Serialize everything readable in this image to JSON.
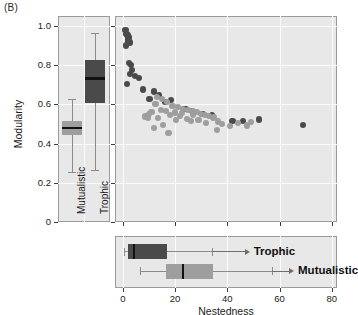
{
  "panel_label": "(B)",
  "colors": {
    "trophic": "#4a4a4a",
    "mutualistic": "#9e9e9e",
    "plot_bg": "#e8e8e8",
    "grid": "#fbfbfb",
    "frame": "#9b9b9b",
    "median": "#111111",
    "whisker": "#8b8b8b"
  },
  "modularity_axis": {
    "label": "Modularity",
    "ticks": [
      "0",
      "0.2",
      "0.4",
      "0.6",
      "0.8",
      "1.0"
    ],
    "values": [
      0,
      0.2,
      0.4,
      0.6,
      0.8,
      1.0
    ],
    "min": 0,
    "max": 1.05
  },
  "nestedness_axis": {
    "label": "Nestedness",
    "ticks": [
      "0",
      "20",
      "40",
      "60",
      "80"
    ],
    "values": [
      0,
      20,
      40,
      60,
      80
    ],
    "min": -3,
    "max": 82
  },
  "group_names": {
    "mutualistic": "Mutualistic",
    "trophic": "Trophic"
  },
  "chart_data": {
    "type": "scatter",
    "title": "(B)",
    "xlabel": "Nestedness",
    "ylabel": "Modularity",
    "xlim": [
      -3,
      82
    ],
    "ylim": [
      0,
      1.05
    ],
    "grid": true,
    "legend": "none",
    "series": [
      {
        "name": "Trophic",
        "color": "#4a4a4a",
        "points": [
          [
            1.0,
            0.98
          ],
          [
            1.4,
            0.96
          ],
          [
            1.8,
            0.955
          ],
          [
            2.2,
            0.94
          ],
          [
            2.0,
            0.925
          ],
          [
            2.6,
            0.915
          ],
          [
            1.2,
            0.9
          ],
          [
            2.4,
            0.81
          ],
          [
            3.0,
            0.8
          ],
          [
            3.6,
            0.775
          ],
          [
            2.8,
            0.755
          ],
          [
            4.6,
            0.745
          ],
          [
            6.2,
            0.735
          ],
          [
            1.6,
            0.705
          ],
          [
            7.8,
            0.675
          ],
          [
            12.0,
            0.665
          ],
          [
            14.0,
            0.645
          ],
          [
            10.2,
            0.628
          ],
          [
            18.5,
            0.622
          ],
          [
            16.0,
            0.612
          ],
          [
            24.0,
            0.575
          ],
          [
            26.5,
            0.565
          ],
          [
            30.5,
            0.552
          ],
          [
            34.0,
            0.545
          ],
          [
            42.0,
            0.515
          ],
          [
            46.0,
            0.515
          ],
          [
            52.0,
            0.522
          ],
          [
            69.0,
            0.495
          ]
        ]
      },
      {
        "name": "Mutualistic",
        "color": "#9e9e9e",
        "points": [
          [
            13.0,
            0.638
          ],
          [
            15.0,
            0.625
          ],
          [
            17.0,
            0.612
          ],
          [
            12.5,
            0.6
          ],
          [
            19.0,
            0.592
          ],
          [
            21.0,
            0.585
          ],
          [
            23.0,
            0.578
          ],
          [
            14.5,
            0.572
          ],
          [
            16.5,
            0.566
          ],
          [
            11.0,
            0.56
          ],
          [
            20.0,
            0.558
          ],
          [
            25.0,
            0.57
          ],
          [
            27.0,
            0.566
          ],
          [
            28.5,
            0.56
          ],
          [
            30.0,
            0.552
          ],
          [
            31.5,
            0.546
          ],
          [
            18.0,
            0.545
          ],
          [
            22.0,
            0.54
          ],
          [
            8.5,
            0.538
          ],
          [
            13.5,
            0.532
          ],
          [
            9.5,
            0.528
          ],
          [
            24.5,
            0.524
          ],
          [
            33.0,
            0.54
          ],
          [
            35.0,
            0.534
          ],
          [
            20.5,
            0.52
          ],
          [
            26.0,
            0.515
          ],
          [
            36.5,
            0.512
          ],
          [
            15.5,
            0.495
          ],
          [
            12.0,
            0.478
          ],
          [
            32.0,
            0.505
          ],
          [
            38.0,
            0.498
          ],
          [
            44.0,
            0.505
          ],
          [
            49.0,
            0.51
          ],
          [
            47.5,
            0.492
          ],
          [
            41.0,
            0.488
          ],
          [
            36.0,
            0.47
          ],
          [
            17.5,
            0.455
          ],
          [
            29.0,
            0.52
          ],
          [
            34.5,
            0.528
          ],
          [
            10.0,
            0.552
          ],
          [
            22.5,
            0.556
          ],
          [
            26.8,
            0.548
          ]
        ]
      }
    ]
  },
  "modularity_boxplots": {
    "type": "box",
    "ylabel": "Modularity",
    "boxes": [
      {
        "name": "Mutualistic",
        "color": "#9e9e9e",
        "whisker_low": 0.255,
        "q1": 0.445,
        "median": 0.478,
        "q3": 0.515,
        "whisker_high": 0.625
      },
      {
        "name": "Trophic",
        "color": "#4a4a4a",
        "whisker_low": 0.265,
        "q1": 0.605,
        "median": 0.732,
        "q3": 0.825,
        "whisker_high": 0.965
      }
    ]
  },
  "nestedness_boxplots": {
    "type": "box",
    "xlabel": "Nestedness",
    "boxes": [
      {
        "name": "Trophic",
        "color": "#4a4a4a",
        "whisker_low": 0.6,
        "q1": 2.0,
        "median": 4.2,
        "q3": 17.0,
        "whisker_high": 34.0
      },
      {
        "name": "Mutualistic",
        "color": "#9e9e9e",
        "whisker_low": 6.5,
        "q1": 16.5,
        "median": 23.0,
        "q3": 34.5,
        "whisker_high": 57.0
      }
    ]
  }
}
